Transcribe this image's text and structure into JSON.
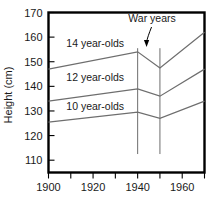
{
  "chart_data": {
    "type": "line",
    "title": "",
    "subtitle": "",
    "xlabel": "",
    "ylabel": "Height (cm)",
    "xlim": [
      1900,
      1970
    ],
    "ylim": [
      105,
      170
    ],
    "grid": false,
    "legend_position": "inline-labels",
    "x_ticks": [
      1900,
      1910,
      1920,
      1930,
      1940,
      1950,
      1960,
      1970
    ],
    "x_tick_labels": [
      "1900",
      "",
      "1920",
      "",
      "1940",
      "",
      "1960",
      ""
    ],
    "y_ticks": [
      110,
      120,
      130,
      140,
      150,
      160,
      170
    ],
    "y_tick_labels": [
      "110",
      "120",
      "130",
      "140",
      "150",
      "160",
      "170"
    ],
    "series": [
      {
        "name": "14 year-olds",
        "color": "#6e6e6e",
        "x": [
          1900,
          1940,
          1950,
          1970
        ],
        "values": [
          147.0,
          154.0,
          147.5,
          162.0
        ]
      },
      {
        "name": "12 year-olds",
        "color": "#6e6e6e",
        "x": [
          1900,
          1940,
          1950,
          1970
        ],
        "values": [
          134.0,
          139.0,
          136.0,
          147.0
        ]
      },
      {
        "name": "10 year-olds",
        "color": "#6e6e6e",
        "x": [
          1900,
          1940,
          1950,
          1970
        ],
        "values": [
          125.5,
          129.5,
          127.0,
          134.0
        ]
      }
    ],
    "annotations": [
      {
        "name": "war-years",
        "text": "War years",
        "x_start": 1940,
        "x_end": 1950,
        "arrow_target_x": 1944
      }
    ],
    "series_inline_labels": [
      {
        "text": "14 year-olds",
        "x": 1908,
        "y": 157.5
      },
      {
        "text": "12 year-olds",
        "x": 1908,
        "y": 143.5
      },
      {
        "text": "10 year-olds",
        "x": 1908,
        "y": 132.0
      }
    ]
  },
  "axes": {
    "y_axis_title": "Height (cm)"
  }
}
